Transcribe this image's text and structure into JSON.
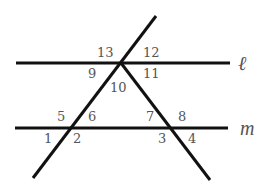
{
  "diagram": {
    "title": "",
    "colors": {
      "line": "#111111",
      "text": "#555555",
      "background": "#ffffff"
    },
    "lines": [
      {
        "name": "line-l",
        "label": "ℓ",
        "x1": 16,
        "y1": 63,
        "x2": 230,
        "y2": 63
      },
      {
        "name": "line-m",
        "label": "m",
        "x1": 15,
        "y1": 128,
        "x2": 228,
        "y2": 128
      },
      {
        "name": "transversal-left",
        "label": "",
        "x1": 156,
        "y1": 16,
        "x2": 33,
        "y2": 178
      },
      {
        "name": "transversal-right",
        "label": "",
        "x1": 121,
        "y1": 63,
        "x2": 210,
        "y2": 180
      }
    ],
    "line_labels": {
      "l": "ℓ",
      "m": "m"
    },
    "angles": {
      "a1": "1",
      "a2": "2",
      "a3": "3",
      "a4": "4",
      "a5": "5",
      "a6": "6",
      "a7": "7",
      "a8": "8",
      "a9": "9",
      "a10": "10",
      "a11": "11",
      "a12": "12",
      "a13": "13"
    }
  }
}
